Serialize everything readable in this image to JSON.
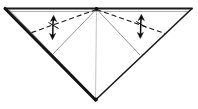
{
  "figure": {
    "width": 198,
    "height": 109,
    "background_color": "#ffffff",
    "line_color": "#1a1a1a",
    "thin_line_color": "#6e6e6e",
    "faint_line_color": "#b4b4b4",
    "dash_pattern": "5,3"
  },
  "geometry": {
    "apex": {
      "x": 96.5,
      "y": 9
    },
    "top_left": {
      "x": 5,
      "y": 8.5
    },
    "top_right": {
      "x": 192,
      "y": 8.5
    },
    "bottom": {
      "x": 95.5,
      "y": 100
    },
    "top_edge_second": {
      "y": 11.5
    },
    "left_crease_end": {
      "x": 52,
      "y": 55
    },
    "right_crease_end": {
      "x": 140,
      "y": 55
    },
    "left_dash_end": {
      "x": 29,
      "y": 33.5
    },
    "right_dash_end": {
      "x": 165,
      "y": 33.5
    },
    "center_line_top": {
      "x": 96.5,
      "y": 9
    },
    "center_line_bottom": {
      "x": 95.5,
      "y": 99
    }
  },
  "strokes": {
    "outline_top_edge": "M 5 8.5 L 192 8.5",
    "outline_top_edge_inner": "M 8 11.5 L 189 11.5",
    "outline_left_edge": "M 5 8.5 L 95.5 100",
    "outline_right_edge": "M 192 8.5 L 95.5 100",
    "layer_left_edge": "M 9 9.5 L 97 100.5",
    "crease_left": "M 96.5 9 L 52 55",
    "crease_right": "M 96.5 9 L 140 55",
    "crease_center": "M 96.5 9 L 95.5 99",
    "fold_left_dashed": "M 96.5 9.5 L 29 33.5",
    "fold_right_dashed": "M 96.5 9.5 L 165 33.5"
  },
  "arrows": [
    {
      "name": "fold-unfold-arrow-left",
      "x": 53,
      "y_top": 16,
      "y_bottom": 38,
      "label": "fold and unfold",
      "direction": "double-headed-vertical"
    },
    {
      "name": "fold-unfold-arrow-right",
      "x": 141,
      "y_top": 15,
      "y_bottom": 37,
      "label": "fold and unfold",
      "direction": "double-headed-vertical"
    }
  ],
  "legend": {
    "dashed_line_meaning": "valley fold",
    "solid_line_meaning": "paper edge",
    "thin_line_meaning": "existing crease",
    "arrow_meaning": "fold and unfold"
  }
}
